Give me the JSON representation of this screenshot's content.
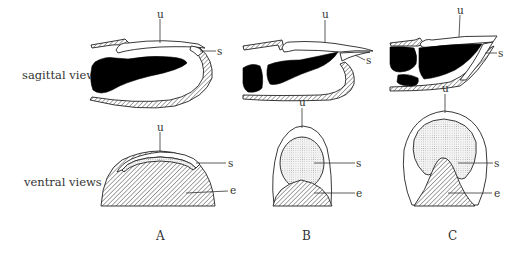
{
  "figure": {
    "row_labels": {
      "sagittal": "sagittal views",
      "ventral": "ventral views"
    },
    "columns": [
      {
        "id": "A",
        "label": "A"
      },
      {
        "id": "B",
        "label": "B"
      },
      {
        "id": "C",
        "label": "C"
      }
    ],
    "part_labels": {
      "unguis": "u",
      "subunguis": "s",
      "epidermis": "e"
    },
    "annotations": {
      "A_sagittal": [
        "u",
        "s"
      ],
      "B_sagittal": [
        "u",
        "s"
      ],
      "C_sagittal": [
        "u",
        "s"
      ],
      "A_ventral": [
        "u",
        "s",
        "e"
      ],
      "B_ventral": [
        "u",
        "s",
        "e"
      ],
      "C_ventral": [
        "u",
        "s",
        "e"
      ]
    },
    "colors": {
      "ink": "#222222",
      "bone": "#000000",
      "background": "#ffffff"
    }
  }
}
